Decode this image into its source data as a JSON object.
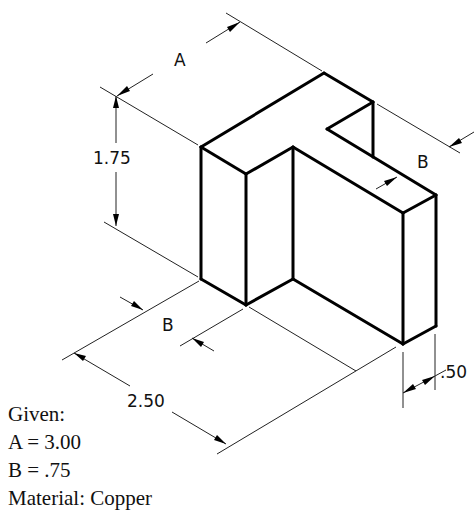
{
  "drawing": {
    "type": "isometric-part-drawing",
    "dimensions": {
      "a_label": "A",
      "height_label": "1.75",
      "b_top_label": "B",
      "b_bottom_label": "B",
      "width_label": "2.50",
      "thickness_label": ".50"
    }
  },
  "given": {
    "heading": "Given:",
    "a_value": "A = 3.00",
    "b_value": "B = .75",
    "material": "Material: Copper"
  }
}
